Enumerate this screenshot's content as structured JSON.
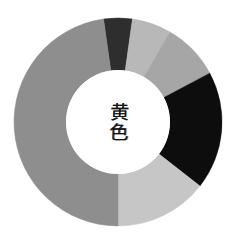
{
  "figure": {
    "title": "",
    "background_color": "#ffffff",
    "width": 237,
    "height": 239
  },
  "center_label": {
    "text": "黄色",
    "meaning_romaji": "kiiro",
    "orientation": "vertical",
    "color": "#141414"
  },
  "chart_data": {
    "type": "pie",
    "variant": "donut",
    "title": "黄色",
    "xlabel": "",
    "ylabel": "",
    "legend_position": "none",
    "grid": false,
    "center_x": 118,
    "center_y": 122,
    "outer_radius": 104,
    "inner_radius": 52,
    "start_angle_deg": -8,
    "direction": "clockwise",
    "hole_color": "#ffffff",
    "labels": [
      "segment-1",
      "segment-2",
      "segment-3",
      "segment-4",
      "segment-5",
      "segment-6"
    ],
    "values": [
      16,
      22,
      32,
      66,
      52,
      172
    ],
    "percentages": [
      4.4,
      6.1,
      8.9,
      18.3,
      14.4,
      47.8
    ],
    "colors": [
      "#2e2e2e",
      "#b8b8b8",
      "#a6a6a6",
      "#0d0d0d",
      "#c6c6c6",
      "#8e8e8e"
    ],
    "segments": [
      {
        "name": "segment-1",
        "color": "#2e2e2e",
        "start_deg": -8,
        "end_deg": 8,
        "sweep_deg": 16,
        "percent": 4.4
      },
      {
        "name": "segment-2",
        "color": "#b8b8b8",
        "start_deg": 8,
        "end_deg": 30,
        "sweep_deg": 22,
        "percent": 6.1
      },
      {
        "name": "segment-3",
        "color": "#a6a6a6",
        "start_deg": 30,
        "end_deg": 62,
        "sweep_deg": 32,
        "percent": 8.9
      },
      {
        "name": "segment-4",
        "color": "#0d0d0d",
        "start_deg": 62,
        "end_deg": 128,
        "sweep_deg": 66,
        "percent": 18.3
      },
      {
        "name": "segment-5",
        "color": "#c6c6c6",
        "start_deg": 128,
        "end_deg": 180,
        "sweep_deg": 52,
        "percent": 14.4
      },
      {
        "name": "segment-6",
        "color": "#8e8e8e",
        "start_deg": 180,
        "end_deg": 352,
        "sweep_deg": 172,
        "percent": 47.8
      }
    ]
  }
}
